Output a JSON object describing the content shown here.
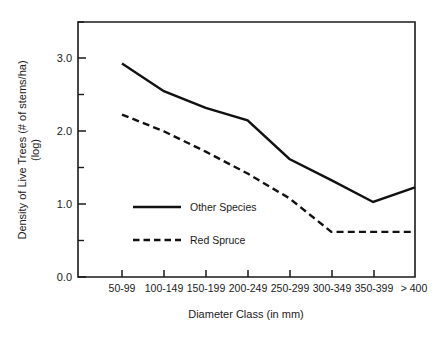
{
  "chart_data": {
    "type": "line",
    "title": "",
    "xlabel": "Diameter Class (in mm)",
    "ylabel_line1": "Density of Live Trees (# of stems/ha)",
    "ylabel_line2": "(log)",
    "categories": [
      "50-99",
      "100-149",
      "150-199",
      "200-249",
      "250-299",
      "300-349",
      "350-399",
      "> 400"
    ],
    "ylim": [
      0.0,
      3.5
    ],
    "ytick_labels": [
      "0.0",
      "1.0",
      "2.0",
      "3.0"
    ],
    "ytick_values": [
      0.0,
      1.0,
      2.0,
      3.0
    ],
    "yminor_values": [
      0.5,
      1.5,
      2.5,
      3.5
    ],
    "grid": false,
    "legend_position": "inside-left",
    "series": [
      {
        "name": "Other Species",
        "style": "solid",
        "color": "#111111",
        "values": [
          2.93,
          2.55,
          2.32,
          2.15,
          1.62,
          1.33,
          1.03,
          1.23
        ]
      },
      {
        "name": "Red Spruce",
        "style": "dashed",
        "color": "#111111",
        "values": [
          2.23,
          2.0,
          1.72,
          1.42,
          1.08,
          0.62,
          0.62,
          0.62
        ]
      }
    ]
  }
}
